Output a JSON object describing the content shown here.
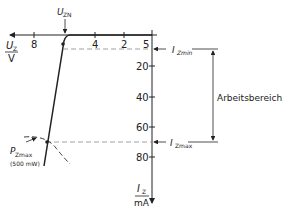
{
  "diagram": {
    "x_axis": {
      "symbol": "U",
      "subscript": "Z",
      "unit": "V",
      "tick_labels": [
        "8",
        "4",
        "2",
        "5"
      ]
    },
    "y_axis": {
      "symbol": "I",
      "subscript": "Z",
      "unit": "mA",
      "tick_labels": [
        "20",
        "40",
        "60",
        "80"
      ]
    },
    "annotations": {
      "uzn": {
        "symbol": "U",
        "subscript": "ZN"
      },
      "izmin": {
        "symbol": "I",
        "subscript": "Zmin"
      },
      "izmax": {
        "symbol": "I",
        "subscript": "Zmax"
      },
      "pzmax": {
        "symbol": "P",
        "subscript": "Zmax",
        "note": "(500 mW)"
      },
      "range_label": "Arbeitsbereich"
    }
  },
  "colors": {
    "line": "#222222",
    "dashed": "#888888",
    "background": "#ffffff"
  }
}
